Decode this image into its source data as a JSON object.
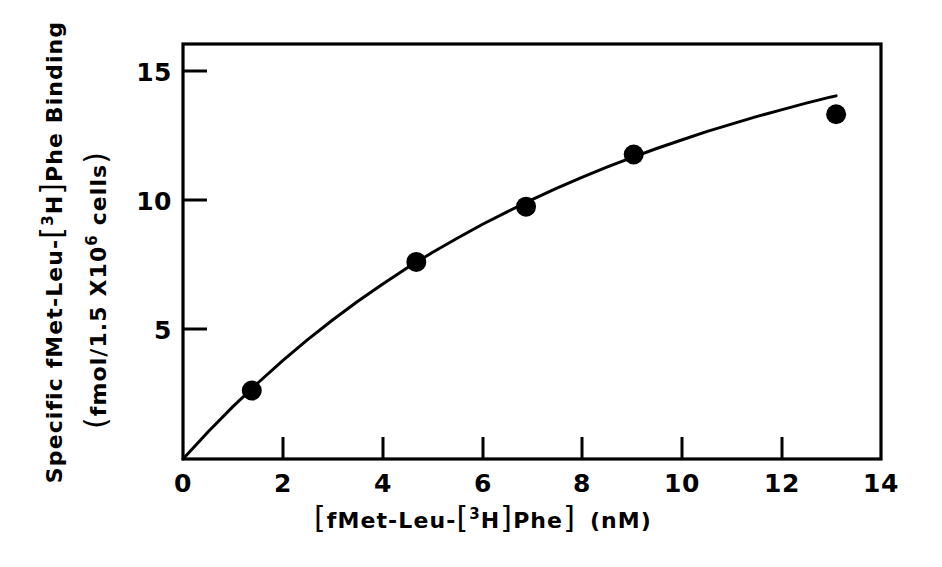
{
  "figure": {
    "background_color": "#ffffff",
    "ink_color": "#000000"
  },
  "chart_data": {
    "type": "scatter",
    "title": "",
    "subtitle": "",
    "xlabel_full": "[fMet-Leu-[3H]Phe]  (nM)",
    "xlabel_parts": {
      "bracket_open": "[",
      "pre": "fMet-Leu-",
      "inner_open": "[",
      "isotope_sup": "3",
      "isotope": "H",
      "inner_close": "]",
      "post": "Phe",
      "bracket_close": "]",
      "units": "(nM)"
    },
    "ylabel_line1_full": "Specific fMet-Leu-[3H]Phe Binding",
    "ylabel_line1_parts": {
      "pre": "Specific fMet-Leu-",
      "inner_open": "[",
      "isotope_sup": "3",
      "isotope": "H",
      "inner_close": "]",
      "post": "Phe Binding"
    },
    "ylabel_line2_full": "(fmol/1.5 X106 cells)",
    "ylabel_line2_parts": {
      "open": "(",
      "pre": "fmol/1.5 X10",
      "exp_sup": "6",
      "post": " cells",
      "close": ")"
    },
    "xlim": [
      0,
      14
    ],
    "ylim": [
      0,
      16
    ],
    "xticks": [
      0,
      2,
      4,
      6,
      8,
      10,
      12,
      14
    ],
    "xtick_labels": [
      "0",
      "2",
      "4",
      "6",
      "8",
      "10",
      "12",
      "14"
    ],
    "yticks": [
      5,
      10,
      15
    ],
    "ytick_labels": [
      "5",
      "10",
      "15"
    ],
    "grid": false,
    "legend": false,
    "legend_position": "none",
    "marker": "filled-circle",
    "marker_radius_px": 10,
    "x": [
      1.38,
      4.68,
      6.88,
      9.04,
      13.1
    ],
    "y": [
      2.64,
      7.6,
      9.73,
      11.74,
      13.29
    ],
    "points": [
      {
        "x": 1.38,
        "y": 2.64
      },
      {
        "x": 4.68,
        "y": 7.6
      },
      {
        "x": 6.88,
        "y": 9.73
      },
      {
        "x": 9.04,
        "y": 11.74
      },
      {
        "x": 13.1,
        "y": 13.29
      }
    ],
    "fit_curve": {
      "description": "hyperbolic saturation binding curve through origin",
      "x": [
        0,
        0.5,
        1.0,
        1.5,
        2.0,
        2.5,
        3.0,
        3.5,
        4.0,
        4.5,
        5.0,
        5.5,
        6.0,
        6.5,
        7.0,
        7.5,
        8.0,
        8.5,
        9.0,
        9.5,
        10.0,
        10.5,
        11.0,
        11.5,
        12.0,
        12.5,
        13.0,
        13.1
      ],
      "y": [
        0,
        1.04,
        2.02,
        2.93,
        3.79,
        4.6,
        5.36,
        6.07,
        6.74,
        7.37,
        7.96,
        8.51,
        9.04,
        9.53,
        10.0,
        10.44,
        10.86,
        11.25,
        11.62,
        11.97,
        12.3,
        12.62,
        12.91,
        13.2,
        13.46,
        13.72,
        13.96,
        14.0
      ]
    }
  }
}
